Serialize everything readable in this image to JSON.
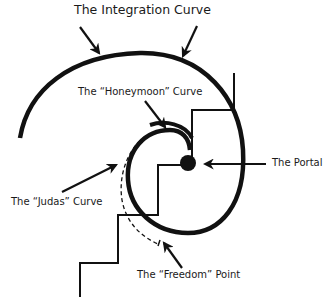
{
  "diagram": {
    "title": "The Integration Curve",
    "labels": {
      "honeymoon": "The “Honeymoon” Curve",
      "portal": "The Portal",
      "judas": "The “Judas” Curve",
      "freedom": "The “Freedom” Point"
    },
    "colors": {
      "stroke": "#111111",
      "background": "#ffffff",
      "text": "#1a1a1a"
    },
    "elements": [
      "integration-curve-spiral",
      "honeymoon-curve-arc",
      "judas-curve-dashed",
      "portal-dot",
      "staircase-upper",
      "staircase-lower",
      "freedom-point-marker"
    ]
  }
}
